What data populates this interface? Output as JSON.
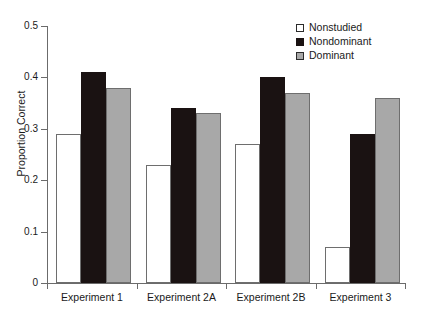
{
  "chart_data": {
    "type": "bar",
    "title": "",
    "xlabel": "",
    "ylabel": "Proportion Correct",
    "categories": [
      "Experiment 1",
      "Experiment 2A",
      "Experiment 2B",
      "Experiment 3"
    ],
    "series": [
      {
        "name": "Nonstudied",
        "color": "#ffffff",
        "values": [
          0.29,
          0.23,
          0.27,
          0.07
        ]
      },
      {
        "name": "Nondominant",
        "color": "#1a1212",
        "values": [
          0.41,
          0.34,
          0.4,
          0.29
        ]
      },
      {
        "name": "Dominant",
        "color": "#a8a8a8",
        "values": [
          0.38,
          0.33,
          0.37,
          0.36
        ]
      }
    ],
    "ylim": [
      0,
      0.5
    ],
    "yticks": [
      0,
      0.1,
      0.2,
      0.3,
      0.4,
      0.5
    ],
    "ytick_labels": [
      "0",
      "0.1",
      "0.2",
      "0.3",
      "0.4",
      "0.5"
    ],
    "grid": false,
    "legend_position": "top-right"
  },
  "axes": {
    "y_title": "Proportion Correct",
    "y_labels": [
      "0.5",
      "0.4",
      "0.3",
      "0.2",
      "0.1",
      "0"
    ],
    "x_labels": [
      "Experiment 1",
      "Experiment 2A",
      "Experiment 2B",
      "Experiment 3"
    ]
  },
  "legend": {
    "items": [
      {
        "label": "Nonstudied",
        "swatch": "open-square-swatch"
      },
      {
        "label": "Nondominant",
        "swatch": "filled-black-square-swatch"
      },
      {
        "label": "Dominant",
        "swatch": "filled-gray-square-swatch"
      }
    ]
  }
}
